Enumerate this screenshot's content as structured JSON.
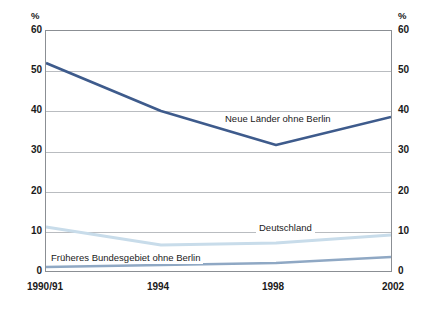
{
  "chart_data": {
    "type": "line",
    "title": "",
    "subtitle": "",
    "xlabel": "",
    "ylabel": "%",
    "ylabel_right": "%",
    "categories": [
      "1990/91",
      "1994",
      "1998",
      "2002"
    ],
    "x": [
      0,
      1,
      2,
      3
    ],
    "ylim": [
      0,
      60
    ],
    "yticks": [
      0,
      10,
      20,
      30,
      40,
      50,
      60
    ],
    "grid": true,
    "legend_position": "inline-annotations",
    "series": [
      {
        "name": "Neue Länder ohne Berlin",
        "color": "#3e5b8c",
        "values": [
          52,
          40,
          31.5,
          38.5
        ],
        "label_position": "inline"
      },
      {
        "name": "Deutschland",
        "color": "#c8dcea",
        "values": [
          11,
          6.5,
          7,
          9
        ],
        "label_position": "inline"
      },
      {
        "name": "Früheres Bundesgebiet ohne Berlin",
        "color": "#8fa8c4",
        "values": [
          1,
          1.5,
          2,
          3.5
        ],
        "label_position": "inline"
      }
    ],
    "annotations": [
      "Neue Länder ohne Berlin",
      "Deutschland",
      "Früheres Bundesgebiet ohne Berlin"
    ]
  },
  "axes": {
    "unit_left": "%",
    "unit_right": "%",
    "y_ticks": [
      "60",
      "50",
      "40",
      "30",
      "20",
      "10",
      "0"
    ],
    "x_ticks": [
      "1990/91",
      "1994",
      "1998",
      "2002"
    ]
  },
  "colors": {
    "frame": "#8b8f94",
    "grid": "#b9bcc0",
    "text": "#1a1a1a",
    "series_dark": "#3e5b8c",
    "series_light": "#c8dcea",
    "series_mid": "#8fa8c4",
    "background": "#ffffff"
  }
}
